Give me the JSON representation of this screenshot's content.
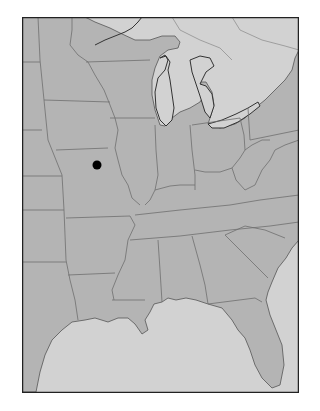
{
  "map": {
    "type": "outline-map",
    "region": "Eastern United States",
    "colors": {
      "page_background": "#ffffff",
      "land": "#b4b4b4",
      "water_and_foreign": "#d2d2d2",
      "state_border": "#6e6e6e",
      "coastline": "#555555",
      "frame": "#222222",
      "marker": "#000000"
    },
    "markers": [
      {
        "id": "location-dot",
        "shape": "filled-circle",
        "approx_location": "northeast Missouri",
        "x": 97,
        "y": 165,
        "radius": 4.5
      }
    ],
    "labels": []
  }
}
